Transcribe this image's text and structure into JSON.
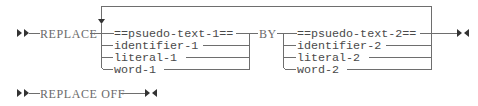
{
  "diagram": {
    "type": "railroad-syntax-diagram",
    "statements": [
      {
        "keyword": "REPLACE",
        "operand_group_1": [
          "==psuedo-text-1==",
          "identifier-1",
          "literal-1",
          "word-1"
        ],
        "connector": "BY",
        "operand_group_2": [
          "==psuedo-text-2==",
          "identifier-2",
          "literal-2",
          "word-2"
        ],
        "repeatable": true
      },
      {
        "keyword": "REPLACE OFF"
      }
    ],
    "markers": {
      "start": "start-of-statement-icon",
      "end": "end-of-statement-icon",
      "repeat": "repeat-arrow-icon"
    }
  }
}
